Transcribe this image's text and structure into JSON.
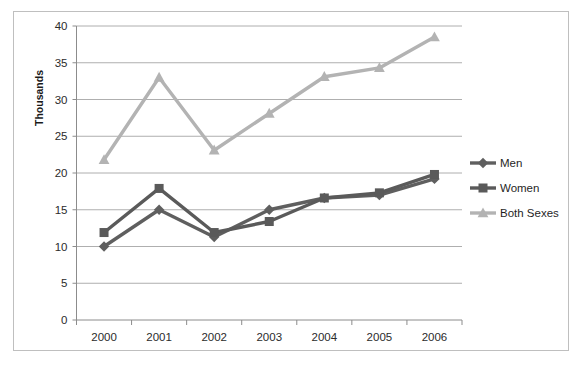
{
  "chart_data": {
    "type": "line",
    "title": "",
    "xlabel": "",
    "ylabel": "Thousands",
    "categories": [
      "2000",
      "2001",
      "2002",
      "2003",
      "2004",
      "2005",
      "2006"
    ],
    "series": [
      {
        "name": "Men",
        "marker": "diamond",
        "color": "#5f5f5f",
        "values": [
          10.0,
          15.0,
          11.3,
          15.0,
          16.6,
          17.0,
          19.2
        ]
      },
      {
        "name": "Women",
        "marker": "square",
        "color": "#5a5a5a",
        "values": [
          11.9,
          17.9,
          11.9,
          13.4,
          16.6,
          17.3,
          19.8
        ]
      },
      {
        "name": "Both Sexes",
        "marker": "triangle",
        "color": "#b3b3b3",
        "values": [
          21.8,
          33.0,
          23.1,
          28.1,
          33.1,
          34.3,
          38.5
        ]
      }
    ],
    "ylim": [
      0,
      40
    ],
    "ytick_values": [
      0,
      5,
      10,
      15,
      20,
      25,
      30,
      35,
      40
    ],
    "ytick_labels": [
      "0",
      "5",
      "10",
      "15",
      "20",
      "25",
      "30",
      "35",
      "40"
    ],
    "grid": true,
    "legend_position": "right",
    "legend_entries": [
      "Men",
      "Women",
      "Both Sexes"
    ]
  },
  "colors": {
    "men": "#5f5f5f",
    "women": "#5a5a5a",
    "both_sexes": "#b3b3b3",
    "gridline": "#9a9a9a",
    "axis": "#8c8c8c",
    "border": "#bfbfbf",
    "text": "#1f1f1f"
  }
}
